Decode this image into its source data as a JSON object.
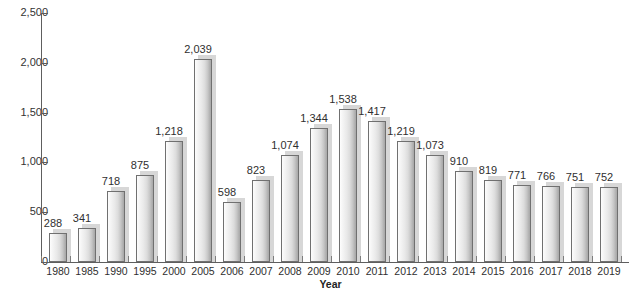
{
  "chart_data": {
    "type": "bar",
    "title": "",
    "xlabel": "Year",
    "ylabel": "",
    "ylim": [
      0,
      2500
    ],
    "yticks": [
      0,
      500,
      1000,
      1500,
      2000,
      2500
    ],
    "ytick_labels": [
      "0",
      "500",
      "1,000",
      "1,500",
      "2,000",
      "2,500"
    ],
    "grid": false,
    "legend": "none",
    "categories": [
      "1980",
      "1985",
      "1990",
      "1995",
      "2000",
      "2005",
      "2006",
      "2007",
      "2008",
      "2009",
      "2010",
      "2011",
      "2012",
      "2013",
      "2014",
      "2015",
      "2016",
      "2017",
      "2018",
      "2019"
    ],
    "values": [
      288,
      341,
      718,
      875,
      1218,
      2039,
      598,
      823,
      1074,
      1344,
      1538,
      1417,
      1219,
      1073,
      910,
      819,
      771,
      766,
      751,
      752
    ],
    "value_labels": [
      "288",
      "341",
      "718",
      "875",
      "1,218",
      "2,039",
      "598",
      "823",
      "1,074",
      "1,344",
      "1,538",
      "1,417",
      "1,219",
      "1,073",
      "910",
      "819",
      "771",
      "766",
      "751",
      "752"
    ]
  },
  "colors": {
    "axis": "#5e5e5e",
    "text": "#2f2f2f",
    "bar_light": "#fdfdfd",
    "bar_dark": "#a8a8a8",
    "bar_border": "#707070",
    "bar_shadow": "#d7d7d7",
    "background": "#ffffff"
  }
}
